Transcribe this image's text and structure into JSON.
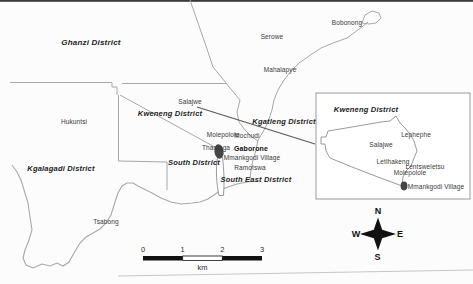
{
  "map": {
    "district_labels": [
      {
        "label": "Ghanzi District",
        "x": 91,
        "y": 43,
        "size": 8
      },
      {
        "label": "Kweneng District",
        "x": 170,
        "y": 114
      },
      {
        "label": "Kgatleng District",
        "x": 284,
        "y": 122
      },
      {
        "label": "Kgalagadi District",
        "x": 61,
        "y": 169
      },
      {
        "label": "South District",
        "x": 194,
        "y": 163
      },
      {
        "label": "South East District",
        "x": 256,
        "y": 180
      }
    ],
    "town_labels": [
      {
        "label": "Bobonong",
        "x": 347,
        "y": 23
      },
      {
        "label": "Serowe",
        "x": 272,
        "y": 37
      },
      {
        "label": "Mahalapye",
        "x": 280,
        "y": 70
      },
      {
        "label": "Salajwe",
        "x": 190,
        "y": 102
      },
      {
        "label": "Hukuntsi",
        "x": 74,
        "y": 122
      },
      {
        "label": "Molepolole",
        "x": 223,
        "y": 135
      },
      {
        "label": "Mochudi",
        "x": 247,
        "y": 136
      },
      {
        "label": "Thamaga",
        "x": 216,
        "y": 148
      },
      {
        "label": "Gaborone",
        "x": 251,
        "y": 148,
        "bold": true
      },
      {
        "label": "Mmankgodi Village",
        "x": 252,
        "y": 158
      },
      {
        "label": "Ramotswa",
        "x": 250,
        "y": 168
      },
      {
        "label": "Tsabong",
        "x": 106,
        "y": 222
      }
    ]
  },
  "inset": {
    "title": "Kweneng District",
    "title_x": 366,
    "title_y": 110,
    "place_labels": [
      {
        "label": "Lephephe",
        "x": 416,
        "y": 135
      },
      {
        "label": "Salajwe",
        "x": 381,
        "y": 145
      },
      {
        "label": "Letlhakeng",
        "x": 393,
        "y": 162
      },
      {
        "label": "Lentsweletsu",
        "x": 425,
        "y": 167
      },
      {
        "label": "Molepolole",
        "x": 410,
        "y": 173
      },
      {
        "label": "Mmankgodi Village",
        "x": 436,
        "y": 187
      }
    ]
  },
  "compass": {
    "north": "N",
    "east": "E",
    "south": "S",
    "west": "W"
  },
  "scale_bar": {
    "tick_labels": [
      "0",
      "1",
      "2",
      "3"
    ],
    "unit": "km"
  },
  "colors": {
    "boundary": "#a8a8a8",
    "railway": "#5a5a5a",
    "marker": "#454545",
    "inset_border": "#999999",
    "compass": "#111111",
    "scale_bar": "#111111"
  }
}
